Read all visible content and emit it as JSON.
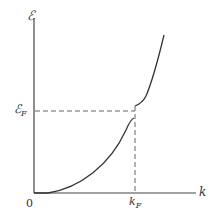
{
  "diagram": {
    "y_axis_label": "ℰ",
    "x_axis_label": "k",
    "origin_label": "0",
    "fermi_energy_label": "ℰ",
    "fermi_energy_subscript": "F",
    "fermi_k_label": "k",
    "fermi_k_subscript": "F",
    "colors": {
      "line": "#333333",
      "dashed": "#555555",
      "background": "#ffffff"
    }
  }
}
